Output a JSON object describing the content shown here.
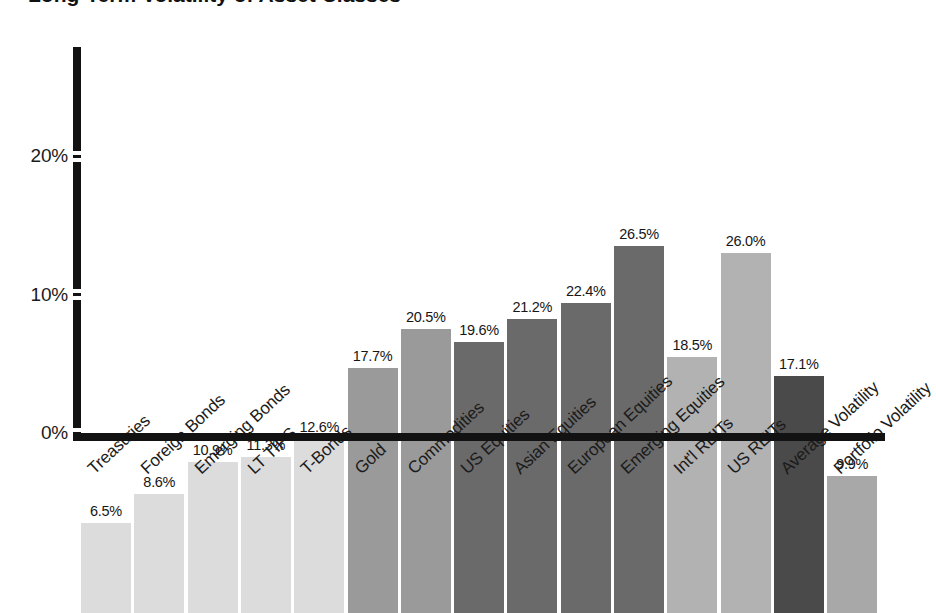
{
  "chart_data": {
    "type": "bar",
    "title": "",
    "xlabel": "",
    "ylabel": "",
    "ylim": [
      0,
      28
    ],
    "grid": false,
    "legend": "none",
    "value_label_suffix": "%",
    "categories": [
      "Treasuries",
      "Foreign Bonds",
      "Emerging Bonds",
      "LT TIPS",
      "T-Bonds",
      "Gold",
      "Commodities",
      "US Equities",
      "Asian Equities",
      "European Equities",
      "Emerging Equities",
      "Int'l REITs",
      "US REITs",
      "Average Volatility",
      "Portfolio Volatility"
    ],
    "values": [
      6.5,
      8.6,
      10.9,
      11.3,
      12.6,
      17.7,
      20.5,
      19.6,
      21.2,
      22.4,
      26.5,
      18.5,
      26.0,
      17.1,
      9.9
    ],
    "value_labels": [
      "6.5%",
      "8.6%",
      "10.9%",
      "11.3%",
      "12.6%",
      "17.7%",
      "20.5%",
      "19.6%",
      "21.2%",
      "22.4%",
      "26.5%",
      "18.5%",
      "26.0%",
      "17.1%",
      "9.9%"
    ],
    "bar_colors": [
      "#dcdcdc",
      "#dcdcdc",
      "#dcdcdc",
      "#dcdcdc",
      "#dcdcdc",
      "#9a9a9a",
      "#9a9a9a",
      "#6a6a6a",
      "#6a6a6a",
      "#6a6a6a",
      "#6a6a6a",
      "#b2b2b2",
      "#b2b2b2",
      "#4a4a4a",
      "#a8a8a8"
    ],
    "yticks": [
      0,
      10,
      20
    ],
    "ytick_labels": [
      "0%",
      "10%",
      "20%"
    ],
    "axis_color": "#121212"
  },
  "title_fragment": "Long-Term Volatility of Asset Classes"
}
